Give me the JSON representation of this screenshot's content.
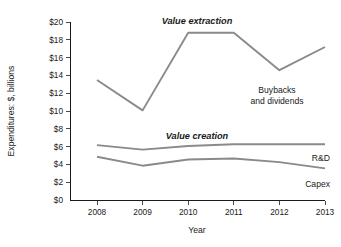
{
  "chart_data": {
    "type": "line",
    "title": "",
    "xlabel": "Year",
    "ylabel": "Expenditures: $, billions",
    "categories": [
      "2008",
      "2009",
      "2010",
      "2011",
      "2012",
      "2013"
    ],
    "x": [
      2008,
      2009,
      2010,
      2011,
      2012,
      2013
    ],
    "ylim": [
      0,
      20
    ],
    "xlim": [
      2008,
      2013
    ],
    "grid": false,
    "legend_position": "inline-right",
    "yticks": [
      0,
      2,
      4,
      6,
      8,
      10,
      12,
      14,
      16,
      18,
      20
    ],
    "ytick_labels": [
      "$0",
      "$2",
      "$4",
      "$6",
      "$8",
      "$10",
      "$12",
      "$14",
      "$16",
      "$18",
      "$20"
    ],
    "xtick_labels": [
      "2008",
      "2009",
      "2010",
      "2011",
      "2012",
      "2013"
    ],
    "series": [
      {
        "name": "Buybacks and dividends",
        "label": "Buybacks\nand dividends",
        "label_line1": "Buybacks",
        "label_line2": "and dividends",
        "group": "Value extraction",
        "color": "#8a8a8a",
        "values": [
          13.5,
          10.1,
          18.8,
          18.8,
          14.6,
          17.2
        ]
      },
      {
        "name": "R&D",
        "label": "R&D",
        "group": "Value creation",
        "color": "#8a8a8a",
        "values": [
          6.2,
          5.7,
          6.1,
          6.3,
          6.3,
          6.3
        ]
      },
      {
        "name": "Capex",
        "label": "Capex",
        "group": "Value creation",
        "color": "#8a8a8a",
        "values": [
          4.9,
          3.9,
          4.6,
          4.7,
          4.3,
          3.6
        ]
      }
    ],
    "annotations": [
      {
        "text": "Value extraction",
        "style": "bold-italic"
      },
      {
        "text": "Value creation",
        "style": "bold-italic"
      }
    ]
  },
  "axes": {
    "y_title": "Expenditures: $, billions",
    "x_title": "Year",
    "y_ticks": [
      "$20",
      "$18",
      "$16",
      "$14",
      "$12",
      "$10",
      "$8",
      "$6",
      "$4",
      "$2",
      "$0"
    ],
    "x_ticks": [
      "2008",
      "2009",
      "2010",
      "2011",
      "2012",
      "2013"
    ]
  },
  "labels": {
    "value_extraction": "Value extraction",
    "value_creation": "Value creation",
    "buybacks_line1": "Buybacks",
    "buybacks_line2": "and dividends",
    "rnd": "R&D",
    "capex": "Capex"
  },
  "colors": {
    "line": "#8a8a8a",
    "axis": "#1a1a1a",
    "text": "#1a1a1a",
    "background": "#ffffff"
  }
}
